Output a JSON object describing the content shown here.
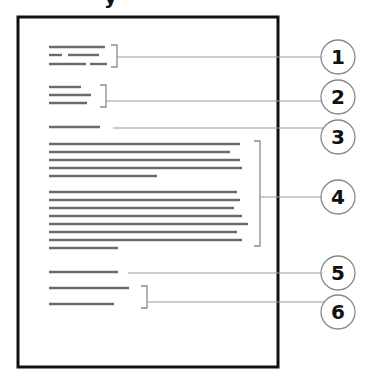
{
  "diagram": {
    "page": {
      "x": 18,
      "y": 17,
      "width": 260,
      "height": 350,
      "border_color": "#111111"
    },
    "colors": {
      "text_line": "#6b6b6b",
      "leader": "#9a9a9a",
      "bracket": "#8a8a8a",
      "circle_stroke": "#8a8a8a",
      "number": "#111111"
    },
    "top_partial_glyph": "y",
    "text_blocks": [
      {
        "id": 1,
        "lines": [
          [
            [
              49,
              105
            ]
          ],
          [
            [
              49,
              62
            ],
            [
              68,
              99
            ]
          ],
          [
            [
              49,
              86
            ],
            [
              90,
              107
            ]
          ]
        ],
        "ys": [
          47,
          55,
          64
        ]
      },
      {
        "id": 2,
        "lines": [
          [
            [
              49,
              81
            ]
          ],
          [
            [
              49,
              91
            ]
          ],
          [
            [
              49,
              87
            ]
          ]
        ],
        "ys": [
          87,
          95,
          103
        ]
      },
      {
        "id": 3,
        "lines": [
          [
            [
              49,
              100
            ]
          ]
        ],
        "ys": [
          127
        ]
      },
      {
        "id": 4,
        "lines": [
          [
            [
              49,
              240
            ]
          ],
          [
            [
              49,
              230
            ]
          ],
          [
            [
              49,
              240
            ]
          ],
          [
            [
              49,
              242
            ]
          ],
          [
            [
              49,
              157
            ]
          ],
          [
            [
              49,
              237
            ]
          ],
          [
            [
              49,
              240
            ]
          ],
          [
            [
              49,
              234
            ]
          ],
          [
            [
              49,
              242
            ]
          ],
          [
            [
              49,
              248
            ]
          ],
          [
            [
              49,
              237
            ]
          ],
          [
            [
              49,
              242
            ]
          ],
          [
            [
              49,
              118
            ]
          ]
        ],
        "ys": [
          144,
          152,
          160,
          168,
          176,
          192,
          200,
          208,
          216,
          224,
          232,
          240,
          248
        ]
      },
      {
        "id": 5,
        "lines": [
          [
            [
              49,
              118
            ]
          ]
        ],
        "ys": [
          272
        ]
      },
      {
        "id": 6,
        "lines": [
          [
            [
              49,
              129
            ]
          ],
          [
            [
              49,
              114
            ]
          ]
        ],
        "ys": [
          288,
          304
        ]
      }
    ],
    "callouts": [
      {
        "number": "1",
        "cx": 338,
        "cy": 57,
        "bracket": {
          "x": 117,
          "y1": 45,
          "y2": 67
        },
        "leader_y": 57,
        "leader_x": 117
      },
      {
        "number": "2",
        "cx": 338,
        "cy": 97,
        "bracket": {
          "x": 106,
          "y1": 85,
          "y2": 107
        },
        "leader_y": 101,
        "leader_x": 106
      },
      {
        "number": "3",
        "cx": 338,
        "cy": 137,
        "bracket": null,
        "leader_y": 128,
        "leader_x": 113
      },
      {
        "number": "4",
        "cx": 338,
        "cy": 197,
        "bracket": {
          "x": 260,
          "y1": 141,
          "y2": 246
        },
        "leader_y": 197,
        "leader_x": 260
      },
      {
        "number": "5",
        "cx": 338,
        "cy": 273,
        "bracket": null,
        "leader_y": 273,
        "leader_x": 128
      },
      {
        "number": "6",
        "cx": 338,
        "cy": 312,
        "bracket": {
          "x": 147,
          "y1": 286,
          "y2": 308
        },
        "leader_y": 302,
        "leader_x": 147
      }
    ],
    "circle_radius": 17
  }
}
